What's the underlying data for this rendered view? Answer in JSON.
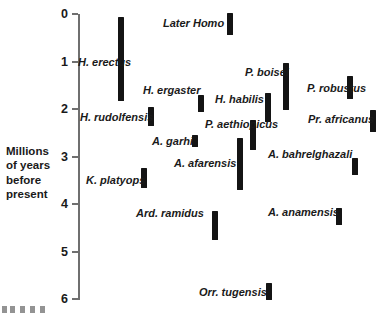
{
  "chart_data": {
    "type": "bar",
    "orientation": "vertical-range",
    "title": "",
    "xlabel": "",
    "ylabel": "Millions of years before present",
    "ylim": [
      0,
      6
    ],
    "y_ticks": [
      0,
      1,
      2,
      3,
      4,
      5,
      6
    ],
    "y_tick_labels": [
      "0",
      "1",
      "2",
      "3",
      "4",
      "5",
      "6"
    ],
    "y_inverted": true,
    "grid": false,
    "legend": "none",
    "categories": [
      "H. erectus",
      "Later Homo",
      "H. ergaster",
      "H. rudolfensis",
      "P. boisei",
      "H. habilis",
      "P. robustus",
      "P. aethiopicus",
      "Pr. africanus",
      "A. garhi",
      "A. afarensis",
      "A. bahrelghazali",
      "K. platyops",
      "Ard. ramidus",
      "A. anamensis",
      "Orr. tugensis"
    ],
    "ranges": [
      {
        "name": "H. erectus",
        "start": 0.06,
        "end": 1.83
      },
      {
        "name": "Later Homo",
        "start": 0.0,
        "end": 0.44
      },
      {
        "name": "H. ergaster",
        "start": 1.71,
        "end": 2.06
      },
      {
        "name": "H. rudolfensis",
        "start": 1.96,
        "end": 2.36
      },
      {
        "name": "P. boisei",
        "start": 1.03,
        "end": 2.02
      },
      {
        "name": "H. habilis",
        "start": 1.66,
        "end": 2.27
      },
      {
        "name": "P. robustus",
        "start": 1.31,
        "end": 1.79
      },
      {
        "name": "P. aethiopicus",
        "start": 2.23,
        "end": 2.86
      },
      {
        "name": "Pr. africanus",
        "start": 2.02,
        "end": 2.48
      },
      {
        "name": "A. garhi",
        "start": 2.55,
        "end": 2.8
      },
      {
        "name": "A. afarensis",
        "start": 2.61,
        "end": 3.71
      },
      {
        "name": "A. bahrelghazali",
        "start": 3.03,
        "end": 3.39
      },
      {
        "name": "K. platyops",
        "start": 3.24,
        "end": 3.66
      },
      {
        "name": "Ard. ramidus",
        "start": 4.15,
        "end": 4.76
      },
      {
        "name": "A. anamensis",
        "start": 4.08,
        "end": 4.44
      },
      {
        "name": "Orr. tugensis",
        "start": 5.66,
        "end": 6.02
      }
    ]
  },
  "axis": {
    "title_line1": "Millions",
    "title_line2": "of years",
    "title_line3": "before",
    "title_line4": "present",
    "ticks": [
      {
        "label": "0",
        "value": 0
      },
      {
        "label": "1",
        "value": 1
      },
      {
        "label": "2",
        "value": 2
      },
      {
        "label": "3",
        "value": 3
      },
      {
        "label": "4",
        "value": 4
      },
      {
        "label": "5",
        "value": 5
      },
      {
        "label": "6",
        "value": 6
      }
    ]
  },
  "taxa": [
    {
      "label": "H. erectus",
      "lx": 78,
      "ly": 62,
      "bar_x": 118,
      "bar_top": 17,
      "bar_bottom": 101
    },
    {
      "label": "Later Homo",
      "lx": 163,
      "ly": 23,
      "bar_x": 227,
      "bar_top": 13,
      "bar_bottom": 35
    },
    {
      "label": "H. ergaster",
      "lx": 143,
      "ly": 90,
      "bar_x": 198,
      "bar_top": 95,
      "bar_bottom": 112
    },
    {
      "label": "H. rudolfensis",
      "lx": 80,
      "ly": 117,
      "bar_x": 148,
      "bar_top": 107,
      "bar_bottom": 126
    },
    {
      "label": "P. boisei",
      "lx": 245,
      "ly": 72,
      "bar_x": 283,
      "bar_top": 63,
      "bar_bottom": 110
    },
    {
      "label": "H. habilis",
      "lx": 215,
      "ly": 99,
      "bar_x": 265,
      "bar_top": 93,
      "bar_bottom": 122
    },
    {
      "label": "P. robustus",
      "lx": 307,
      "ly": 88,
      "bar_x": 347,
      "bar_top": 76,
      "bar_bottom": 99
    },
    {
      "label": "P. aethiopicus",
      "lx": 205,
      "ly": 124,
      "bar_x": 250,
      "bar_top": 120,
      "bar_bottom": 150
    },
    {
      "label": "Pr. africanus",
      "lx": 308,
      "ly": 119,
      "bar_x": 370,
      "bar_top": 110,
      "bar_bottom": 132
    },
    {
      "label": "A. garhi",
      "lx": 152,
      "ly": 141,
      "bar_x": 192,
      "bar_top": 135,
      "bar_bottom": 147
    },
    {
      "label": "A. afarensis",
      "lx": 174,
      "ly": 163,
      "bar_x": 237,
      "bar_top": 138,
      "bar_bottom": 190
    },
    {
      "label": "A. bahrelghazali",
      "lx": 268,
      "ly": 154,
      "bar_x": 352,
      "bar_top": 158,
      "bar_bottom": 175
    },
    {
      "label": "K. platyops",
      "lx": 86,
      "ly": 180,
      "bar_x": 141,
      "bar_top": 168,
      "bar_bottom": 188
    },
    {
      "label": "Ard. ramidus",
      "lx": 136,
      "ly": 213,
      "bar_x": 212,
      "bar_top": 211,
      "bar_bottom": 240
    },
    {
      "label": "A. anamensis",
      "lx": 268,
      "ly": 212,
      "bar_x": 336,
      "bar_top": 208,
      "bar_bottom": 225
    },
    {
      "label": "Orr. tugensis",
      "lx": 199,
      "ly": 292,
      "bar_x": 266,
      "bar_top": 283,
      "bar_bottom": 300
    }
  ],
  "colors": {
    "bar": "#141414",
    "axis": "#6f6f6f",
    "text": "#1a1a1a",
    "background": "#ffffff"
  }
}
